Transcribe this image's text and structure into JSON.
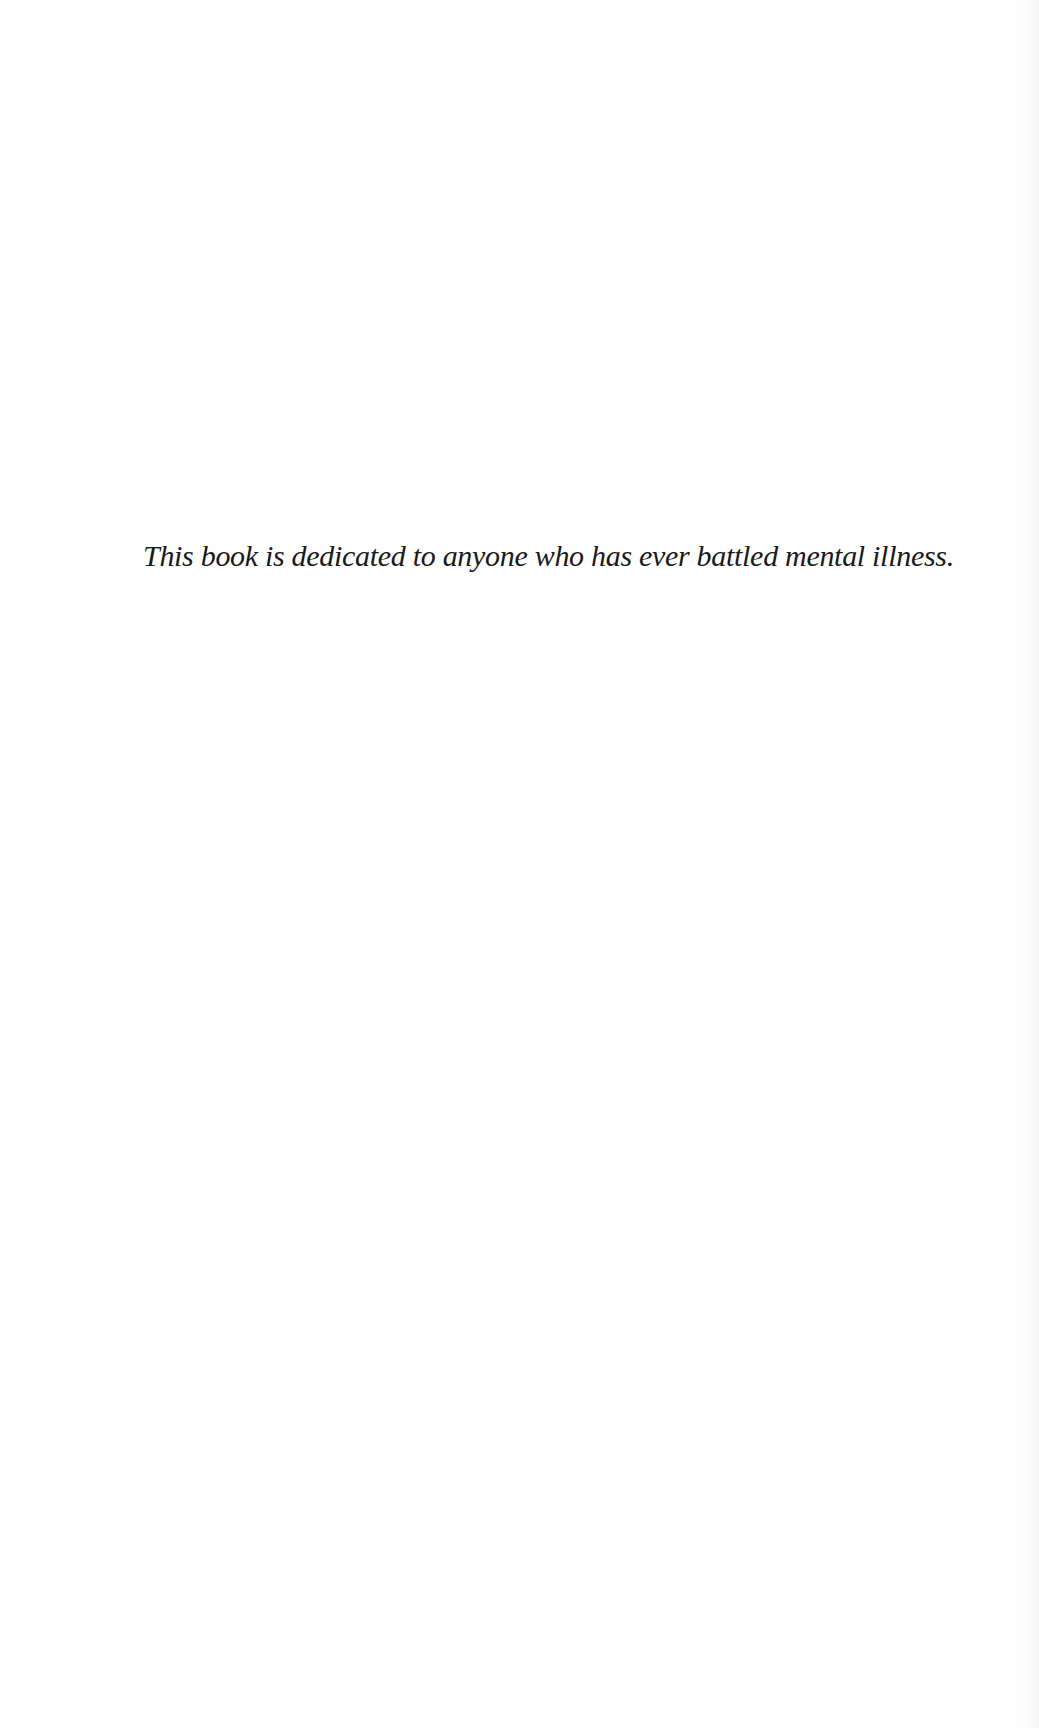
{
  "page": {
    "dedication": "This book is dedicated to anyone who has ever battled mental illness."
  }
}
